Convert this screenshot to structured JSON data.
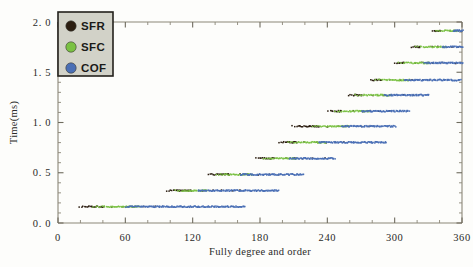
{
  "figure": {
    "background_color": "#fdfdfb",
    "axis_color": "#8b8778"
  },
  "legend": {
    "position": "top-left",
    "box_fill": "#d2d2c8",
    "box_border": "#23211c",
    "entries": [
      {
        "label": "SFR",
        "color": "#2b1d10",
        "marker": "circle"
      },
      {
        "label": "SFC",
        "color": "#7ac143",
        "marker": "circle"
      },
      {
        "label": "COF",
        "color": "#4a6fb5",
        "marker": "circle"
      }
    ]
  },
  "chart_data": {
    "type": "scatter",
    "title": "",
    "xlabel": "Fully degree and order",
    "ylabel": "Time(ms)",
    "xlim": [
      0,
      360
    ],
    "ylim": [
      0,
      2.0
    ],
    "xticks": [
      0,
      60,
      120,
      180,
      240,
      300,
      360
    ],
    "xticklabels": [
      "0",
      "60",
      "120",
      "180",
      "240",
      "300",
      "360"
    ],
    "yticks": [
      0.0,
      0.5,
      1.0,
      1.5,
      2.0
    ],
    "yticklabels": [
      "0. 0",
      "0. 5",
      "1. 0",
      "1. 5",
      "2. 0"
    ],
    "x_minor_interval": 20,
    "y_minor_interval": 0.1,
    "grid": false,
    "legend_position": "upper left",
    "series": [
      {
        "name": "SFR",
        "color": "#2b1d10",
        "description": "Sparse dark points marking the leading edge of each step band",
        "bands": [
          {
            "y": 0.17,
            "x_start": 18,
            "x_end": 40
          },
          {
            "y": 0.33,
            "x_start": 96,
            "x_end": 118
          },
          {
            "y": 0.49,
            "x_start": 133,
            "x_end": 152
          },
          {
            "y": 0.65,
            "x_start": 176,
            "x_end": 192
          },
          {
            "y": 0.81,
            "x_start": 196,
            "x_end": 212
          },
          {
            "y": 0.97,
            "x_start": 208,
            "x_end": 232
          },
          {
            "y": 1.12,
            "x_start": 240,
            "x_end": 252
          },
          {
            "y": 1.28,
            "x_start": 258,
            "x_end": 270
          },
          {
            "y": 1.43,
            "x_start": 278,
            "x_end": 288
          },
          {
            "y": 1.6,
            "x_start": 299,
            "x_end": 308
          },
          {
            "y": 1.76,
            "x_start": 314,
            "x_end": 322
          },
          {
            "y": 1.92,
            "x_start": 333,
            "x_end": 340
          }
        ]
      },
      {
        "name": "SFC",
        "color": "#7ac143",
        "description": "Green points forming the left/middle portion of each step band",
        "bands": [
          {
            "y": 0.17,
            "x_start": 30,
            "x_end": 72
          },
          {
            "y": 0.33,
            "x_start": 104,
            "x_end": 132
          },
          {
            "y": 0.49,
            "x_start": 140,
            "x_end": 172
          },
          {
            "y": 0.65,
            "x_start": 182,
            "x_end": 212
          },
          {
            "y": 0.81,
            "x_start": 204,
            "x_end": 238
          },
          {
            "y": 0.97,
            "x_start": 226,
            "x_end": 258
          },
          {
            "y": 1.12,
            "x_start": 246,
            "x_end": 276
          },
          {
            "y": 1.28,
            "x_start": 264,
            "x_end": 296
          },
          {
            "y": 1.43,
            "x_start": 282,
            "x_end": 312
          },
          {
            "y": 1.6,
            "x_start": 303,
            "x_end": 330
          },
          {
            "y": 1.76,
            "x_start": 318,
            "x_end": 345
          },
          {
            "y": 1.92,
            "x_start": 336,
            "x_end": 356
          }
        ]
      },
      {
        "name": "COF",
        "color": "#4a6fb5",
        "description": "Dense blue points forming the right/trailing portion of each step band",
        "bands": [
          {
            "y": 0.17,
            "x_start": 60,
            "x_end": 166
          },
          {
            "y": 0.33,
            "x_start": 124,
            "x_end": 196
          },
          {
            "y": 0.49,
            "x_start": 162,
            "x_end": 218
          },
          {
            "y": 0.65,
            "x_start": 206,
            "x_end": 246
          },
          {
            "y": 0.81,
            "x_start": 232,
            "x_end": 292
          },
          {
            "y": 0.97,
            "x_start": 252,
            "x_end": 300
          },
          {
            "y": 1.12,
            "x_start": 270,
            "x_end": 312
          },
          {
            "y": 1.28,
            "x_start": 290,
            "x_end": 330
          },
          {
            "y": 1.43,
            "x_start": 308,
            "x_end": 358
          },
          {
            "y": 1.6,
            "x_start": 326,
            "x_end": 360
          },
          {
            "y": 1.76,
            "x_start": 342,
            "x_end": 360
          },
          {
            "y": 1.92,
            "x_start": 352,
            "x_end": 360
          }
        ]
      }
    ]
  }
}
